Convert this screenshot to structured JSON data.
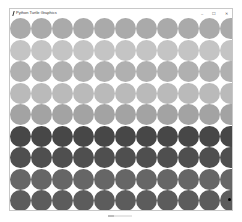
{
  "window": {
    "title": "Python Turtle Graphics",
    "controls": {
      "minimize": "–",
      "maximize": "☐",
      "close": "✕"
    }
  },
  "canvas": {
    "columns": 11,
    "rows": 9,
    "dot_diameter": 21,
    "spacing_x": 21,
    "spacing_y": 21.5,
    "row_colors": [
      "#aaaaaa",
      "#c4c4c4",
      "#b0b0b0",
      "#bababa",
      "#a3a3a3",
      "#474747",
      "#4f4f4f",
      "#666666",
      "#5c5c5c"
    ],
    "background": "#ffffff",
    "turtle": {
      "row": 8,
      "col": 10,
      "color": "#000000"
    }
  }
}
